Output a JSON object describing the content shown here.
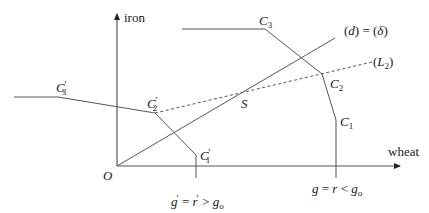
{
  "diagram": {
    "axes": {
      "x_label": "wheat",
      "y_label": "iron",
      "origin_label": "O"
    },
    "lines": {
      "d_label": "(d) = (δ)",
      "L2_label": "(L2)",
      "L2_base": "L",
      "L2_sub": "2",
      "d_text_left": "(",
      "d_text_d": "d",
      "d_text_mid": ") = (",
      "d_text_delta": "δ",
      "d_text_right": ")"
    },
    "points": {
      "S": "S",
      "C3": {
        "base": "C",
        "sub": "3"
      },
      "C2": {
        "base": "C",
        "sub": "2"
      },
      "C1": {
        "base": "C",
        "sub": "1"
      },
      "C3p": {
        "base": "C",
        "sub": "3",
        "prime": "′"
      },
      "C2p": {
        "base": "C",
        "sub": "2",
        "prime": "′"
      },
      "C1p": {
        "base": "C",
        "sub": "1",
        "prime": "′"
      }
    },
    "annotations": {
      "right_condition": "g = r < g₀",
      "left_condition": "g′ = r′ > g₀",
      "rc_g": "g",
      "rc_eq": " = ",
      "rc_r": "r",
      "rc_lt": " < ",
      "rc_g0": "g",
      "rc_sub": "o",
      "lc_g": "g",
      "lc_p1": "′",
      "lc_eq": " = ",
      "lc_r": "r",
      "lc_p2": "′",
      "lc_gt": " > ",
      "lc_g0": "g",
      "lc_sub": "o"
    },
    "colors": {
      "stroke": "#555555",
      "text": "#222222",
      "background": "#ffffff"
    }
  }
}
